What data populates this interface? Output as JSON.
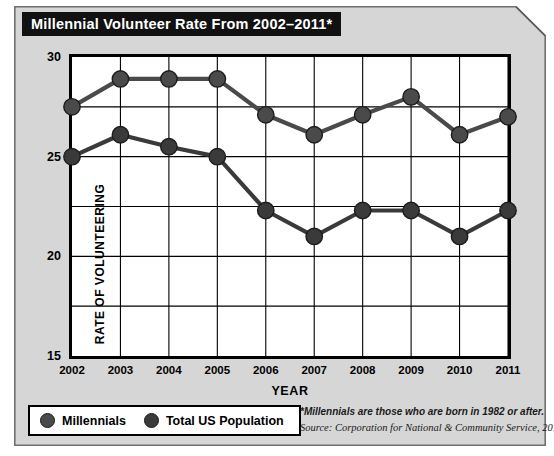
{
  "title": "Millennial Volunteer Rate From 2002–2011*",
  "legend": [
    {
      "label": "Millennials",
      "color": "#4a4a4a"
    },
    {
      "label": "Total US Population",
      "color": "#3a3a3a"
    }
  ],
  "footnotes": [
    "*Millennials are those who are born in 1982 or after.",
    "Source: Corporation for National & Community Service, 2011"
  ],
  "chart_data": {
    "type": "line",
    "title": "Millennial Volunteer Rate From 2002–2011*",
    "xlabel": "YEAR",
    "ylabel": "RATE OF VOLUNTEERING",
    "categories": [
      "2002",
      "2003",
      "2004",
      "2005",
      "2006",
      "2007",
      "2008",
      "2009",
      "2010",
      "2011"
    ],
    "x": [
      2002,
      2003,
      2004,
      2005,
      2006,
      2007,
      2008,
      2009,
      2010,
      2011
    ],
    "ylim": [
      15,
      30
    ],
    "yticks": [
      15,
      20,
      25,
      30
    ],
    "ytick_labels": [
      "15",
      "20",
      "25",
      "30"
    ],
    "y_gridlines": [
      15,
      17.5,
      20,
      22.5,
      25,
      27.5,
      30
    ],
    "grid": true,
    "legend_position": "bottom-left",
    "marker": "circle",
    "series": [
      {
        "name": "Millennials",
        "color": "#4a4a4a",
        "values": [
          27.5,
          28.9,
          28.9,
          28.9,
          27.1,
          26.1,
          27.1,
          28.0,
          26.1,
          27.0
        ]
      },
      {
        "name": "Total US Population",
        "color": "#3a3a3a",
        "values": [
          25.0,
          26.1,
          25.5,
          25.0,
          22.3,
          21.0,
          22.3,
          22.3,
          21.0,
          22.3
        ]
      }
    ]
  }
}
